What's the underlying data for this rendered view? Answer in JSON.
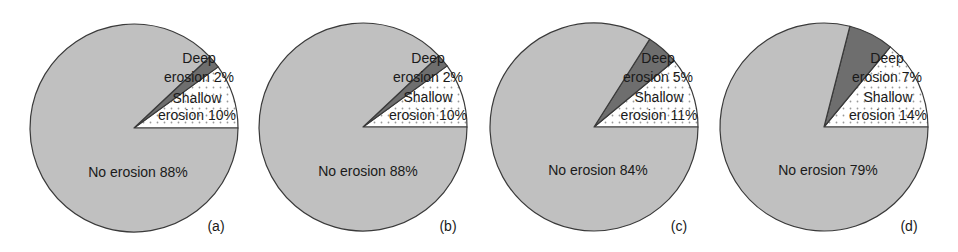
{
  "chart_data": [
    {
      "type": "pie",
      "panel_label": "(a)",
      "start_angle_deg": 0,
      "direction": "counterclockwise",
      "center": [
        134,
        128
      ],
      "radius": 104,
      "slices": [
        {
          "label": "Shallow erosion",
          "value": 10,
          "display": [
            "Shallow",
            "erosion 10%"
          ],
          "fill": "dots"
        },
        {
          "label": "Deep erosion",
          "value": 2,
          "display": [
            "Deep",
            "erosion 2%"
          ],
          "fill": "#6e6e6e"
        },
        {
          "label": "No erosion",
          "value": 88,
          "display": [
            "No erosion 88%"
          ],
          "fill": "#c0c0c0"
        }
      ]
    },
    {
      "type": "pie",
      "panel_label": "(b)",
      "start_angle_deg": 0,
      "direction": "counterclockwise",
      "center": [
        363,
        127
      ],
      "radius": 104,
      "slices": [
        {
          "label": "Shallow erosion",
          "value": 10,
          "display": [
            "Shallow",
            "erosion 10%"
          ],
          "fill": "dots"
        },
        {
          "label": "Deep erosion",
          "value": 2,
          "display": [
            "Deep",
            "erosion 2%"
          ],
          "fill": "#6e6e6e"
        },
        {
          "label": "No erosion",
          "value": 88,
          "display": [
            "No erosion 88%"
          ],
          "fill": "#c0c0c0"
        }
      ]
    },
    {
      "type": "pie",
      "panel_label": "(c)",
      "start_angle_deg": 0,
      "direction": "counterclockwise",
      "center": [
        594,
        127
      ],
      "radius": 104,
      "slices": [
        {
          "label": "Shallow erosion",
          "value": 11,
          "display": [
            "Shallow",
            "erosion 11%"
          ],
          "fill": "dots"
        },
        {
          "label": "Deep erosion",
          "value": 5,
          "display": [
            "Deep",
            "erosion 5%"
          ],
          "fill": "#6e6e6e"
        },
        {
          "label": "No erosion",
          "value": 84,
          "display": [
            "No erosion 84%"
          ],
          "fill": "#c0c0c0"
        }
      ]
    },
    {
      "type": "pie",
      "panel_label": "(d)",
      "start_angle_deg": 0,
      "direction": "counterclockwise",
      "center": [
        824,
        127
      ],
      "radius": 104,
      "slices": [
        {
          "label": "Shallow erosion",
          "value": 14,
          "display": [
            "Shallow",
            "erosion 14%"
          ],
          "fill": "dots"
        },
        {
          "label": "Deep erosion",
          "value": 7,
          "display": [
            "Deep",
            "erosion 7%"
          ],
          "fill": "#6e6e6e"
        },
        {
          "label": "No erosion",
          "value": 79,
          "display": [
            "No erosion 79%"
          ],
          "fill": "#c0c0c0"
        }
      ]
    }
  ],
  "layout": {
    "label_positions": [
      {
        "shallow": [
          197,
          103,
          120
        ],
        "deep": [
          199,
          63,
          82
        ],
        "no": [
          138,
          177
        ],
        "panel": [
          216,
          231
        ]
      },
      {
        "shallow": [
          428,
          102,
          120
        ],
        "deep": [
          428,
          63,
          82
        ],
        "no": [
          368,
          176
        ],
        "panel": [
          448,
          231
        ]
      },
      {
        "shallow": [
          659,
          102,
          120
        ],
        "deep": [
          658,
          63,
          82
        ],
        "no": [
          598,
          175
        ],
        "panel": [
          679,
          231
        ]
      },
      {
        "shallow": [
          888,
          102,
          120
        ],
        "deep": [
          887,
          63,
          82
        ],
        "no": [
          828,
          175
        ],
        "panel": [
          909,
          231
        ]
      }
    ]
  },
  "colors": {
    "outline": "#3a3a3a",
    "no_erosion": "#c0c0c0",
    "deep_erosion": "#6e6e6e",
    "shallow_bg": "#ffffff",
    "dot": "#9a9a9a"
  }
}
